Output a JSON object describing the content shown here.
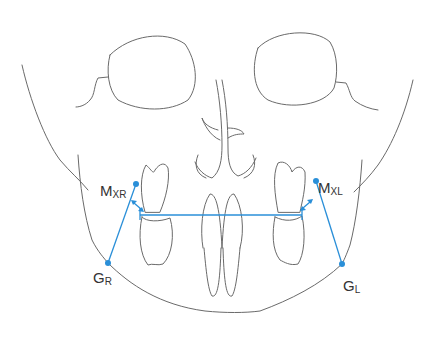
{
  "figure": {
    "colors": {
      "outline": "#6a6a6a",
      "measurement": "#2a8fd8",
      "label": "#333333",
      "background": "#ffffff"
    },
    "landmarks": [
      {
        "id": "MXR",
        "main": "M",
        "sub": "XR",
        "x": 136,
        "y": 184
      },
      {
        "id": "MXL",
        "main": "M",
        "sub": "XL",
        "x": 316,
        "y": 181
      },
      {
        "id": "GR",
        "main": "G",
        "sub": "R",
        "x": 108,
        "y": 263
      },
      {
        "id": "GL",
        "main": "G",
        "sub": "L",
        "x": 342,
        "y": 264
      }
    ],
    "lines": [
      {
        "from": "MXR",
        "to": "GR"
      },
      {
        "from": "MXL",
        "to": "GL"
      },
      {
        "name": "occlusal-transverse-line",
        "from": [
          140,
          215
        ],
        "to": [
          302,
          215
        ]
      }
    ],
    "arrows": [
      {
        "name": "right-double-arrow",
        "from": [
          133,
          202
        ],
        "to": [
          141,
          209
        ]
      },
      {
        "name": "left-double-arrow",
        "from": [
          311,
          201
        ],
        "to": [
          302,
          209
        ]
      }
    ],
    "caption": ""
  }
}
